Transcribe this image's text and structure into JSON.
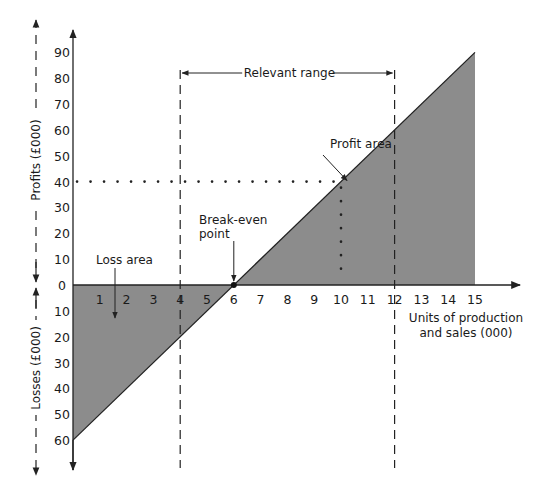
{
  "chart_data": {
    "type": "area",
    "xlabel": "Units of production and sales (000)",
    "ylabel_top": "Profits (£000)",
    "ylabel_bottom": "Losses (£000)",
    "x_ticks": [
      "1",
      "2",
      "3",
      "4",
      "5",
      "6",
      "7",
      "8",
      "9",
      "10",
      "11",
      "12",
      "13",
      "14",
      "15"
    ],
    "profit_ticks": [
      "90",
      "80",
      "70",
      "60",
      "50",
      "40",
      "30",
      "20",
      "10",
      "0"
    ],
    "loss_ticks": [
      "10",
      "20",
      "30",
      "40",
      "50",
      "60"
    ],
    "xlim": [
      0,
      16
    ],
    "ylim": [
      -60,
      90
    ],
    "series": [
      {
        "name": "Profit/Loss",
        "x": [
          0,
          15
        ],
        "y": [
          -60,
          90
        ]
      }
    ],
    "break_even": {
      "x": 6,
      "y": 0,
      "label": "Break-even point"
    },
    "relevant_range": {
      "from": 4,
      "to": 12,
      "label": "Relevant range"
    },
    "reference_point": {
      "x": 10,
      "y": 40
    },
    "annotations": {
      "profit_area": "Profit area",
      "loss_area": "Loss area",
      "break_even_line1": "Break-even",
      "break_even_line2": "point",
      "xlabel_line1": "Units of production",
      "xlabel_line2": "and sales (000)"
    },
    "grid": false,
    "colors": {
      "fill": "#8c8c8c",
      "line": "#222222"
    }
  }
}
